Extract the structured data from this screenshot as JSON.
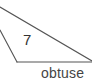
{
  "figure": {
    "shape_label": "7",
    "caption": "obtuse",
    "stroke_color": "#555555",
    "background": "#ffffff"
  }
}
